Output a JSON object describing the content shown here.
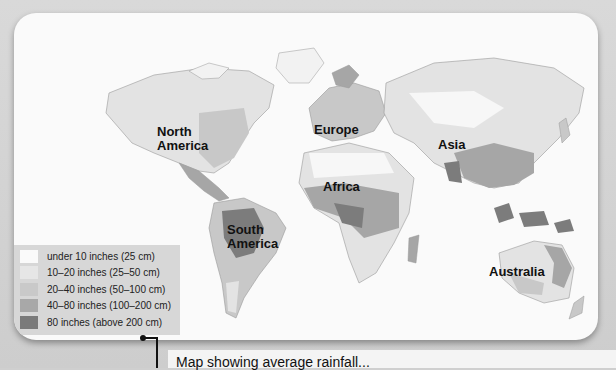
{
  "map": {
    "title": "World annual precipitation",
    "continent_labels": [
      {
        "id": "north-america",
        "text_line1": "North",
        "text_line2": "America"
      },
      {
        "id": "europe",
        "text_line1": "Europe"
      },
      {
        "id": "asia",
        "text_line1": "Asia"
      },
      {
        "id": "africa",
        "text_line1": "Africa"
      },
      {
        "id": "south-america",
        "text_line1": "South",
        "text_line2": "America"
      },
      {
        "id": "australia",
        "text_line1": "Australia"
      }
    ]
  },
  "legend": {
    "items": [
      {
        "label": "under 10 inches (25 cm)",
        "color": "#fafafa"
      },
      {
        "label": "10–20 inches (25–50 cm)",
        "color": "#e6e6e6"
      },
      {
        "label": "20–40 inches (50–100 cm)",
        "color": "#c9c9c9"
      },
      {
        "label": "40–80 inches (100–200 cm)",
        "color": "#a8a8a8"
      },
      {
        "label": "80 inches (above 200 cm)",
        "color": "#7a7a7a"
      }
    ]
  },
  "caption": {
    "text": "Map showing average rainfall..."
  },
  "colors": {
    "background": "#d0d0d0",
    "card": "#fafafa",
    "land_dry": "#f2f2f2",
    "land_light": "#e3e3e3",
    "land_mid": "#c8c8c8",
    "land_wet": "#a6a6a6",
    "land_very_wet": "#7c7c7c"
  }
}
